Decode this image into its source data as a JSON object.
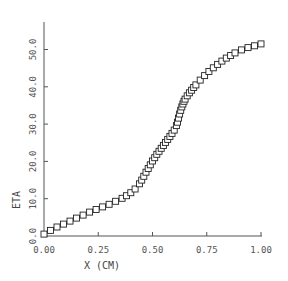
{
  "chart_data": {
    "type": "line",
    "title": "",
    "xlabel": "X (CM)",
    "ylabel": "ETA",
    "xlim": [
      0.0,
      1.0
    ],
    "ylim": [
      0.0,
      52.0
    ],
    "x_ticks": [
      "0.00",
      "0.25",
      "0.50",
      "0.75",
      "1.00"
    ],
    "y_ticks": [
      "0.0",
      "10.0",
      "20.0",
      "30.0",
      "40.0",
      "50.0"
    ],
    "grid": false,
    "legend": null,
    "marker": "square",
    "series": [
      {
        "name": "ETA",
        "x": [
          0.0,
          0.03,
          0.06,
          0.09,
          0.12,
          0.15,
          0.18,
          0.21,
          0.24,
          0.27,
          0.3,
          0.33,
          0.36,
          0.38,
          0.4,
          0.42,
          0.44,
          0.45,
          0.46,
          0.47,
          0.48,
          0.49,
          0.5,
          0.51,
          0.52,
          0.53,
          0.54,
          0.55,
          0.56,
          0.57,
          0.58,
          0.59,
          0.6,
          0.61,
          0.615,
          0.62,
          0.625,
          0.63,
          0.635,
          0.64,
          0.645,
          0.65,
          0.66,
          0.67,
          0.68,
          0.69,
          0.7,
          0.72,
          0.74,
          0.76,
          0.78,
          0.8,
          0.82,
          0.84,
          0.86,
          0.88,
          0.91,
          0.94,
          0.97,
          1.0
        ],
        "values": [
          0.5,
          1.5,
          2.4,
          3.2,
          4.0,
          4.8,
          5.6,
          6.4,
          7.1,
          7.8,
          8.5,
          9.3,
          10.1,
          10.8,
          11.6,
          12.6,
          14.0,
          15.0,
          16.0,
          17.1,
          18.1,
          19.1,
          20.1,
          21.0,
          21.9,
          22.7,
          23.5,
          24.3,
          25.1,
          25.9,
          26.7,
          27.5,
          28.4,
          29.6,
          30.5,
          31.6,
          32.7,
          33.7,
          34.6,
          35.4,
          36.1,
          36.7,
          37.6,
          38.4,
          39.1,
          39.8,
          40.5,
          41.8,
          43.0,
          44.1,
          45.1,
          46.0,
          46.9,
          47.7,
          48.4,
          49.1,
          49.9,
          50.5,
          51.0,
          51.5
        ]
      }
    ]
  }
}
